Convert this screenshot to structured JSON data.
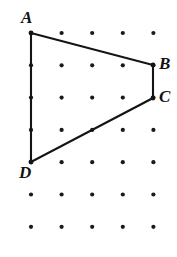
{
  "figure": {
    "background_color": "#ffffff",
    "ink_color": "#141414",
    "dot_color": "#1a1a1a",
    "canvas": {
      "width": 177,
      "height": 257
    },
    "grid": {
      "origin_x": 31,
      "origin_y": 33,
      "step_x": 30.6,
      "step_y": 32.3,
      "columns": 5,
      "rows": 7,
      "dot_radius": 2.1
    },
    "shape": {
      "name": "quadrilateral",
      "closed": true,
      "vertices": [
        {
          "label": "A",
          "col": 0,
          "row": 0,
          "x": 31,
          "y": 33
        },
        {
          "label": "B",
          "col": 4,
          "row": 1,
          "x": 153,
          "y": 65
        },
        {
          "label": "C",
          "col": 4,
          "row": 2,
          "x": 153,
          "y": 98
        },
        {
          "label": "D",
          "col": 0,
          "row": 4,
          "x": 31,
          "y": 162
        }
      ],
      "edges": [
        "AB",
        "BC",
        "CD",
        "DA"
      ]
    },
    "labels": {
      "a": "A",
      "b": "B",
      "c": "C",
      "d": "D"
    }
  }
}
